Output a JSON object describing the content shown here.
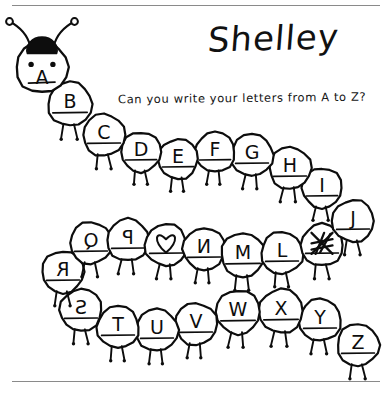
{
  "page": {
    "title": "Shelley",
    "prompt": "Can you write your letters from A to Z?",
    "background_color": "#ffffff",
    "ink_color": "#0d0d0d",
    "rule_color": "#8a8a8a"
  },
  "rules": {
    "top_label": "top-divider-line",
    "bottom_label": "bottom-divider-line"
  },
  "caterpillar": {
    "head": {
      "letter": "A",
      "description": "caterpillar-head-with-antennae",
      "cx": 42,
      "cy": 67,
      "r": 26
    },
    "rows": [
      {
        "name": "row-1",
        "direction": "left-to-right",
        "segments": [
          {
            "letter": "B",
            "cx": 70,
            "cy": 104,
            "r": 22,
            "style": "normal",
            "legs": "down"
          },
          {
            "letter": "C",
            "cx": 104,
            "cy": 135,
            "r": 21,
            "style": "normal",
            "legs": "down"
          },
          {
            "letter": "D",
            "cx": 141,
            "cy": 152,
            "r": 20,
            "style": "normal",
            "legs": "down"
          },
          {
            "letter": "E",
            "cx": 178,
            "cy": 159,
            "r": 20,
            "style": "normal",
            "legs": "down"
          },
          {
            "letter": "F",
            "cx": 215,
            "cy": 152,
            "r": 20,
            "style": "normal",
            "legs": "down"
          },
          {
            "letter": "G",
            "cx": 252,
            "cy": 155,
            "r": 21,
            "style": "normal",
            "legs": "down"
          },
          {
            "letter": "H",
            "cx": 290,
            "cy": 168,
            "r": 21,
            "style": "normal",
            "legs": "down"
          },
          {
            "letter": "I",
            "cx": 322,
            "cy": 188,
            "r": 20,
            "style": "normal",
            "legs": "down"
          },
          {
            "letter": "J",
            "cx": 353,
            "cy": 221,
            "r": 21,
            "style": "normal",
            "legs": "down"
          }
        ]
      },
      {
        "name": "row-2",
        "direction": "right-to-left",
        "segments": [
          {
            "letter": "K",
            "cx": 322,
            "cy": 245,
            "r": 21,
            "style": "scribbled",
            "legs": "down"
          },
          {
            "letter": "L",
            "cx": 282,
            "cy": 253,
            "r": 21,
            "style": "normal",
            "legs": "down"
          },
          {
            "letter": "M",
            "cx": 243,
            "cy": 255,
            "r": 22,
            "style": "normal",
            "legs": "down"
          },
          {
            "letter": "N",
            "cx": 204,
            "cy": 249,
            "r": 21,
            "style": "mirrored",
            "legs": "down"
          },
          {
            "letter": "O",
            "cx": 166,
            "cy": 245,
            "r": 21,
            "style": "heart",
            "legs": "down"
          },
          {
            "letter": "P",
            "cx": 128,
            "cy": 240,
            "r": 21,
            "style": "mirrored",
            "legs": "down"
          },
          {
            "letter": "Q",
            "cx": 91,
            "cy": 243,
            "r": 21,
            "style": "mirrored",
            "legs": "down"
          },
          {
            "letter": "R",
            "cx": 63,
            "cy": 272,
            "r": 21,
            "style": "mirrored",
            "legs": "down"
          }
        ]
      },
      {
        "name": "row-3",
        "direction": "left-to-right",
        "segments": [
          {
            "letter": "S",
            "cx": 81,
            "cy": 310,
            "r": 21,
            "style": "mirrored",
            "legs": "down"
          },
          {
            "letter": "T",
            "cx": 118,
            "cy": 327,
            "r": 21,
            "style": "normal",
            "legs": "down"
          },
          {
            "letter": "U",
            "cx": 157,
            "cy": 330,
            "r": 21,
            "style": "normal",
            "legs": "down"
          },
          {
            "letter": "V",
            "cx": 196,
            "cy": 324,
            "r": 21,
            "style": "normal",
            "legs": "down"
          },
          {
            "letter": "W",
            "cx": 238,
            "cy": 312,
            "r": 22,
            "style": "normal",
            "legs": "down"
          },
          {
            "letter": "X",
            "cx": 281,
            "cy": 311,
            "r": 22,
            "style": "normal",
            "legs": "down"
          },
          {
            "letter": "Y",
            "cx": 320,
            "cy": 320,
            "r": 21,
            "style": "normal",
            "legs": "down"
          },
          {
            "letter": "Z",
            "cx": 358,
            "cy": 345,
            "r": 21,
            "style": "normal",
            "legs": "down"
          }
        ]
      }
    ]
  }
}
